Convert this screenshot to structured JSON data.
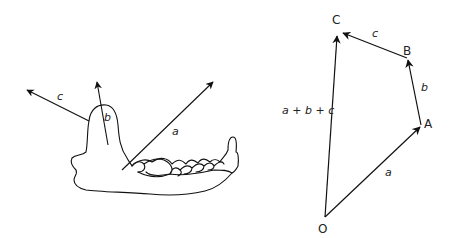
{
  "figure": {
    "left_panel": {
      "description": "lower jaw (mandible) with three force vectors",
      "vectors": [
        {
          "id": "a",
          "label": "a"
        },
        {
          "id": "b",
          "label": "b"
        },
        {
          "id": "c",
          "label": "c"
        }
      ]
    },
    "right_panel": {
      "description": "vector addition polygon",
      "points": [
        {
          "id": "O",
          "label": "O"
        },
        {
          "id": "A",
          "label": "A"
        },
        {
          "id": "B",
          "label": "B"
        },
        {
          "id": "C",
          "label": "C"
        }
      ],
      "vectors": [
        {
          "id": "a",
          "label": "a",
          "from": "O",
          "to": "A"
        },
        {
          "id": "b",
          "label": "b",
          "from": "A",
          "to": "B"
        },
        {
          "id": "c",
          "label": "c",
          "from": "B",
          "to": "C"
        },
        {
          "id": "sum",
          "label": "a + b + c",
          "from": "O",
          "to": "C"
        }
      ]
    },
    "colors": {
      "stroke": "#111111",
      "text": "#222222",
      "background": "#ffffff"
    }
  }
}
